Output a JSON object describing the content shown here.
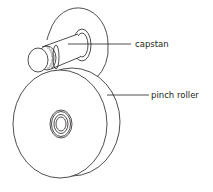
{
  "diagram": {
    "type": "technical line drawing",
    "stroke_color": "#231f20",
    "background_color": "#ffffff",
    "labels": [
      {
        "id": "capstan",
        "text": "capstan"
      },
      {
        "id": "pinch_roller",
        "text": "pinch roller"
      }
    ],
    "components": [
      {
        "name": "capstan flange disk",
        "shape": "ellipse"
      },
      {
        "name": "capstan shaft",
        "shape": "knurled cylinder"
      },
      {
        "name": "pinch roller",
        "shape": "wheel"
      },
      {
        "name": "pinch roller hub",
        "shape": "concentric rings"
      }
    ]
  }
}
